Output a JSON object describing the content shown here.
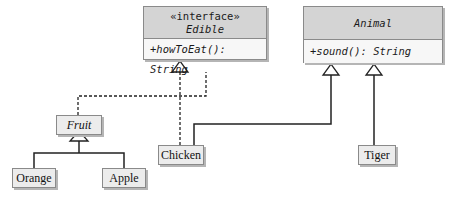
{
  "interfaces": [
    {
      "id": "edible",
      "stereotype": "«interface»",
      "name": "Edible",
      "methods": [
        "+howToEat(): String"
      ]
    }
  ],
  "abstract_classes": [
    {
      "id": "animal",
      "name": "Animal",
      "methods": [
        "+sound(): String"
      ]
    },
    {
      "id": "fruit",
      "name": "Fruit"
    }
  ],
  "classes": [
    {
      "id": "chicken",
      "name": "Chicken"
    },
    {
      "id": "tiger",
      "name": "Tiger"
    },
    {
      "id": "orange",
      "name": "Orange"
    },
    {
      "id": "apple",
      "name": "Apple"
    }
  ],
  "relationships": [
    {
      "from": "Fruit",
      "to": "Edible",
      "type": "realization"
    },
    {
      "from": "Chicken",
      "to": "Edible",
      "type": "realization"
    },
    {
      "from": "Chicken",
      "to": "Animal",
      "type": "inheritance"
    },
    {
      "from": "Tiger",
      "to": "Animal",
      "type": "inheritance"
    },
    {
      "from": "Orange",
      "to": "Fruit",
      "type": "inheritance"
    },
    {
      "from": "Apple",
      "to": "Fruit",
      "type": "inheritance"
    }
  ]
}
